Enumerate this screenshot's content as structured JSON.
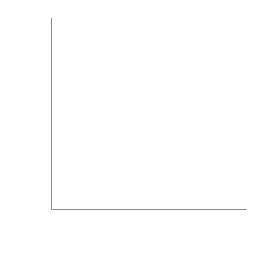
{
  "chart_data": {
    "type": "scatter",
    "title": "",
    "xlabel": "Height",
    "xlabel_variable": "(x)",
    "ylabel": "Weight",
    "ylabel_variable": "(y)",
    "xlabel_full": "Height (x)",
    "ylabel_full": "Weight (y)",
    "grid": false,
    "legend": "none",
    "xlim": [
      0,
      12
    ],
    "ylim": [
      0,
      11
    ],
    "xticks": [
      1,
      2,
      3,
      4,
      5,
      6,
      7,
      8,
      9,
      10,
      11
    ],
    "yticks": [
      1,
      2,
      3,
      4,
      5,
      6,
      7,
      8,
      9,
      10
    ],
    "xtick_labels": [],
    "ytick_labels": [],
    "axes_style": "left-and-bottom-spine",
    "marker": "filled-circle",
    "marker_color": "#1a1a1a",
    "marker_size_px": 4.2,
    "axis_color": "#8c8c8c",
    "background_color": "#ffffff",
    "n_points": 41,
    "relationship": "positive",
    "points": [
      {
        "x": 1.65,
        "y": 1.55
      },
      {
        "x": 2.95,
        "y": 2.25
      },
      {
        "x": 3.65,
        "y": 1.55
      },
      {
        "x": 4.45,
        "y": 1.65
      },
      {
        "x": 4.45,
        "y": 2.75
      },
      {
        "x": 4.45,
        "y": 4.35
      },
      {
        "x": 4.45,
        "y": 5.45
      },
      {
        "x": 5.05,
        "y": 1.45
      },
      {
        "x": 5.05,
        "y": 3.35
      },
      {
        "x": 5.05,
        "y": 4.15
      },
      {
        "x": 5.05,
        "y": 4.85
      },
      {
        "x": 5.05,
        "y": 5.85
      },
      {
        "x": 5.75,
        "y": 1.95
      },
      {
        "x": 5.75,
        "y": 5.35
      },
      {
        "x": 5.75,
        "y": 6.45
      },
      {
        "x": 5.75,
        "y": 7.15
      },
      {
        "x": 6.25,
        "y": 4.45
      },
      {
        "x": 6.25,
        "y": 5.05
      },
      {
        "x": 6.25,
        "y": 6.45
      },
      {
        "x": 6.25,
        "y": 7.85
      },
      {
        "x": 6.45,
        "y": 2.05
      },
      {
        "x": 6.95,
        "y": 3.45
      },
      {
        "x": 6.95,
        "y": 4.45
      },
      {
        "x": 6.95,
        "y": 5.05
      },
      {
        "x": 7.15,
        "y": 1.95
      },
      {
        "x": 7.55,
        "y": 4.45
      },
      {
        "x": 7.55,
        "y": 5.05
      },
      {
        "x": 7.55,
        "y": 6.95
      },
      {
        "x": 7.55,
        "y": 8.55
      },
      {
        "x": 7.95,
        "y": 5.05
      },
      {
        "x": 7.95,
        "y": 6.55
      },
      {
        "x": 8.35,
        "y": 4.25
      },
      {
        "x": 8.35,
        "y": 7.05
      },
      {
        "x": 8.35,
        "y": 8.15
      },
      {
        "x": 8.55,
        "y": 9.25
      },
      {
        "x": 9.05,
        "y": 6.05
      },
      {
        "x": 9.05,
        "y": 7.45
      },
      {
        "x": 9.15,
        "y": 4.05
      },
      {
        "x": 9.25,
        "y": 1.85
      },
      {
        "x": 9.75,
        "y": 8.65
      },
      {
        "x": 10.75,
        "y": 9.95
      }
    ]
  }
}
